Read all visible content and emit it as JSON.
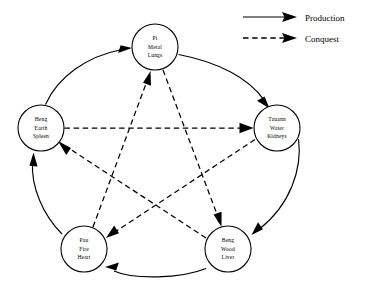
{
  "diagram": {
    "type": "cycle-diagram",
    "colors": {
      "stroke": "#000000",
      "background": "#ffffff",
      "node_fill": "#ffffff"
    },
    "nodes": [
      {
        "id": "metal",
        "position": "top",
        "cx": 155,
        "cy": 47,
        "r": 23,
        "lines": [
          "Pi",
          "Metal",
          "Lungs"
        ],
        "line1": "Pi",
        "line2": "Metal",
        "line3": "Lungs"
      },
      {
        "id": "water",
        "position": "right",
        "cx": 277,
        "cy": 128,
        "r": 23,
        "lines": [
          "Tzuann",
          "Water",
          "Kidneys"
        ],
        "line1": "Tzuann",
        "line2": "Water",
        "line3": "Kidneys"
      },
      {
        "id": "wood",
        "position": "bottom-right",
        "cx": 228,
        "cy": 249,
        "r": 23,
        "lines": [
          "Beng",
          "Wood",
          "Liver"
        ],
        "line1": "Beng",
        "line2": "Wood",
        "line3": "Liver"
      },
      {
        "id": "fire",
        "position": "bottom-left",
        "cx": 84,
        "cy": 249,
        "r": 23,
        "lines": [
          "Pau",
          "Fire",
          "Heart"
        ],
        "line1": "Pau",
        "line2": "Fire",
        "line3": "Heart"
      },
      {
        "id": "earth",
        "position": "left",
        "cx": 41,
        "cy": 128,
        "r": 23,
        "lines": [
          "Heng",
          "Earth",
          "Spleen"
        ],
        "line1": "Heng",
        "line2": "Earth",
        "line3": "Spleen"
      }
    ],
    "production_edges": [
      {
        "from": "earth",
        "to": "metal",
        "style": "solid"
      },
      {
        "from": "metal",
        "to": "water",
        "style": "solid"
      },
      {
        "from": "water",
        "to": "wood",
        "style": "solid"
      },
      {
        "from": "wood",
        "to": "fire",
        "style": "solid"
      },
      {
        "from": "fire",
        "to": "earth",
        "style": "solid"
      }
    ],
    "conquest_edges": [
      {
        "from": "earth",
        "to": "water",
        "style": "dashed"
      },
      {
        "from": "water",
        "to": "fire",
        "style": "dashed"
      },
      {
        "from": "fire",
        "to": "metal",
        "style": "dashed"
      },
      {
        "from": "metal",
        "to": "wood",
        "style": "dashed"
      },
      {
        "from": "wood",
        "to": "earth",
        "style": "dashed"
      }
    ]
  },
  "legend": {
    "items": [
      {
        "id": "production",
        "label": "Production",
        "style": "solid"
      },
      {
        "id": "conquest",
        "label": "Conquest",
        "style": "dashed"
      }
    ],
    "production_label": "Production",
    "conquest_label": "Conquest"
  }
}
